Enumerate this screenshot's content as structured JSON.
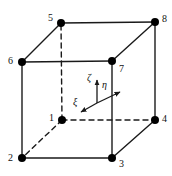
{
  "figure": {
    "width": 172,
    "height": 176,
    "background_color": "#ffffff",
    "line_color": "#1a1a1a",
    "node_color": "#000000",
    "node_radius": 4,
    "solid_line_width": 1.4,
    "dashed_line_width": 1.4,
    "dash_pattern": "5,4"
  },
  "nodes": [
    {
      "id": "1",
      "label": "1",
      "x": 62,
      "y": 120,
      "label_x": 49,
      "label_y": 113,
      "hidden": true
    },
    {
      "id": "2",
      "label": "2",
      "x": 22,
      "y": 158,
      "label_x": 8,
      "label_y": 153,
      "hidden": false
    },
    {
      "id": "3",
      "label": "3",
      "x": 112,
      "y": 158,
      "label_x": 119,
      "label_y": 159,
      "hidden": false
    },
    {
      "id": "4",
      "label": "4",
      "x": 155,
      "y": 120,
      "label_x": 162,
      "label_y": 114,
      "hidden": false
    },
    {
      "id": "5",
      "label": "5",
      "x": 61,
      "y": 23,
      "label_x": 48,
      "label_y": 13,
      "hidden": false
    },
    {
      "id": "6",
      "label": "6",
      "x": 22,
      "y": 62,
      "label_x": 8,
      "label_y": 56,
      "hidden": false
    },
    {
      "id": "7",
      "label": "7",
      "x": 112,
      "y": 61,
      "label_x": 119,
      "label_y": 64,
      "hidden": false
    },
    {
      "id": "8",
      "label": "8",
      "x": 155,
      "y": 22,
      "label_x": 162,
      "label_y": 14,
      "hidden": false
    }
  ],
  "edges_solid": [
    {
      "name": "edge-6-5",
      "from": "6",
      "to": "5"
    },
    {
      "name": "edge-5-8",
      "from": "5",
      "to": "8"
    },
    {
      "name": "edge-8-7",
      "from": "8",
      "to": "7"
    },
    {
      "name": "edge-7-6",
      "from": "7",
      "to": "6"
    },
    {
      "name": "edge-6-2",
      "from": "6",
      "to": "2"
    },
    {
      "name": "edge-7-3",
      "from": "7",
      "to": "3"
    },
    {
      "name": "edge-8-4",
      "from": "8",
      "to": "4"
    },
    {
      "name": "edge-2-3",
      "from": "2",
      "to": "3"
    },
    {
      "name": "edge-3-4",
      "from": "3",
      "to": "4"
    }
  ],
  "edges_dashed": [
    {
      "name": "edge-1-5",
      "from": "1",
      "to": "5"
    },
    {
      "name": "edge-1-4",
      "from": "1",
      "to": "4"
    },
    {
      "name": "edge-1-2",
      "from": "1",
      "to": "2"
    }
  ],
  "axes": {
    "origin_x": 97,
    "origin_y": 103,
    "items": [
      {
        "id": "zeta",
        "symbol": "ζ",
        "direction": "up",
        "tip_x": 97,
        "tip_y": 80,
        "label_x": 87,
        "label_y": 73
      },
      {
        "id": "eta",
        "symbol": "η",
        "direction": "right",
        "tip_x": 120,
        "tip_y": 92,
        "label_x": 102,
        "label_y": 80
      },
      {
        "id": "xi",
        "symbol": "ξ",
        "direction": "down-left",
        "tip_x": 81,
        "tip_y": 112,
        "label_x": 73,
        "label_y": 97
      }
    ]
  }
}
